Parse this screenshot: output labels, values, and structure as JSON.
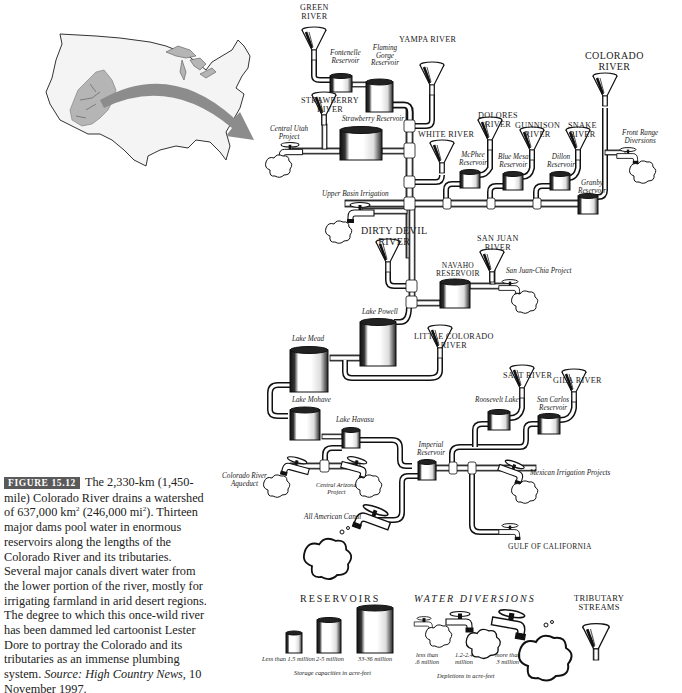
{
  "caption": {
    "figure_label": "FIGURE 15.12",
    "text_1": "The 2,330-km (1,450-mile) Colorado River drains a watershed of 637,000 km",
    "sup_1": "2",
    "text_2": " (246,000 mi",
    "sup_2": "2",
    "text_3": "). Thirteen major dams pool water in enormous reservoirs along the lengths of the Colorado River and its tributaries. Several major canals divert water from the lower portion of the river, mostly for irrigating farmland in arid desert regions. The degree to which this once-wild river has been dammed led cartoonist Lester Dore to portray the Colorado and its tributaries as an immense plumbing system.",
    "source_label": "Source: High Country News,",
    "source_date": " 10 November 1997."
  },
  "map": {
    "region": "Contiguous United States",
    "highlight": "Colorado River watershed",
    "colors": {
      "land": "#f2f2f2",
      "outline": "#333333",
      "watershed": "#b5b5b5",
      "lakes": "#b5b5b5",
      "arrow": "#8c8c8c"
    }
  },
  "tributaries": {
    "green_river": [
      "GREEN",
      "RIVER"
    ],
    "strawberry_river": [
      "STRAWBERRY",
      "RIVER"
    ],
    "yampa_river": "YAMPA RIVER",
    "white_river": "WHITE RIVER",
    "dolores_river": [
      "DOLORES",
      "RIVER"
    ],
    "gunnison_river": [
      "GUNNISON",
      "RIVER"
    ],
    "snake_river": [
      "SNAKE",
      "RIVER"
    ],
    "colorado_river": [
      "COLORADO",
      "RIVER"
    ],
    "dirty_devil_river": [
      "DIRTY DEVIL",
      "RIVER"
    ],
    "san_juan_river": [
      "SAN JUAN",
      "RIVER"
    ],
    "little_colorado_river": [
      "LITTLE COLORADO",
      "RIVER"
    ],
    "salt_river": "SALT RIVER",
    "gila_river": "GILA RIVER"
  },
  "reservoirs": {
    "fontenelle": [
      "Fontenelle",
      "Reservoir"
    ],
    "flaming_gorge": [
      "Flaming",
      "Gorge",
      "Reservoir"
    ],
    "strawberry": "Strawberry Reservoir",
    "mcphee": [
      "McPhee",
      "Reservoir"
    ],
    "blue_mesa": [
      "Blue Mesa",
      "Reservoir"
    ],
    "dillon": [
      "Dillon",
      "Reservoir"
    ],
    "granby": [
      "Granby",
      "Reservoir"
    ],
    "navaho": [
      "NAVAHO",
      "RESERVOIR"
    ],
    "lake_powell": "Lake Powell",
    "lake_mead": "Lake Mead",
    "lake_mohave": "Lake Mohave",
    "lake_havasu": "Lake Havasu",
    "imperial": [
      "Imperial",
      "Reservoir"
    ],
    "roosevelt_lake": "Roosevelt Lake",
    "san_carlos": [
      "San Carlos",
      "Reservoir"
    ]
  },
  "diversions": {
    "central_utah_project": [
      "Central Utah",
      "Project"
    ],
    "front_range": [
      "Front Range",
      "Diversions"
    ],
    "upper_basin_irrigation": "Upper Basin Irrigation",
    "san_juan_chama": "San Juan-Chia Project",
    "colorado_river_aqueduct": [
      "Colorado River",
      "Aqueduct"
    ],
    "central_arizona_project": [
      "Central Arizona",
      "Project"
    ],
    "all_american_canal": "All American Canal",
    "mexican_irrigation": "Mexican Irrigation Projects",
    "gulf": "GULF OF CALIFORNIA"
  },
  "legend": {
    "reservoirs": {
      "title": "RESERVOIRS",
      "items": [
        "Less than 1.5 million",
        "2-5 million",
        "33-36 million"
      ],
      "footnote": "Storage capacities in acre-feet"
    },
    "water_diversions": {
      "title": "WATER DIVERSIONS",
      "items": [
        [
          "less than",
          ".6 million"
        ],
        [
          "1.2-2.4",
          "million"
        ],
        [
          "more than",
          "3 million"
        ]
      ],
      "footnote": "Depletions in acre-feet"
    },
    "tributary_streams": {
      "title": [
        "TRIBUTARY",
        "STREAMS"
      ]
    }
  },
  "colors": {
    "ink": "#1a1a1a",
    "paper": "#ffffff",
    "caption_badge": "#5a5a5a"
  }
}
